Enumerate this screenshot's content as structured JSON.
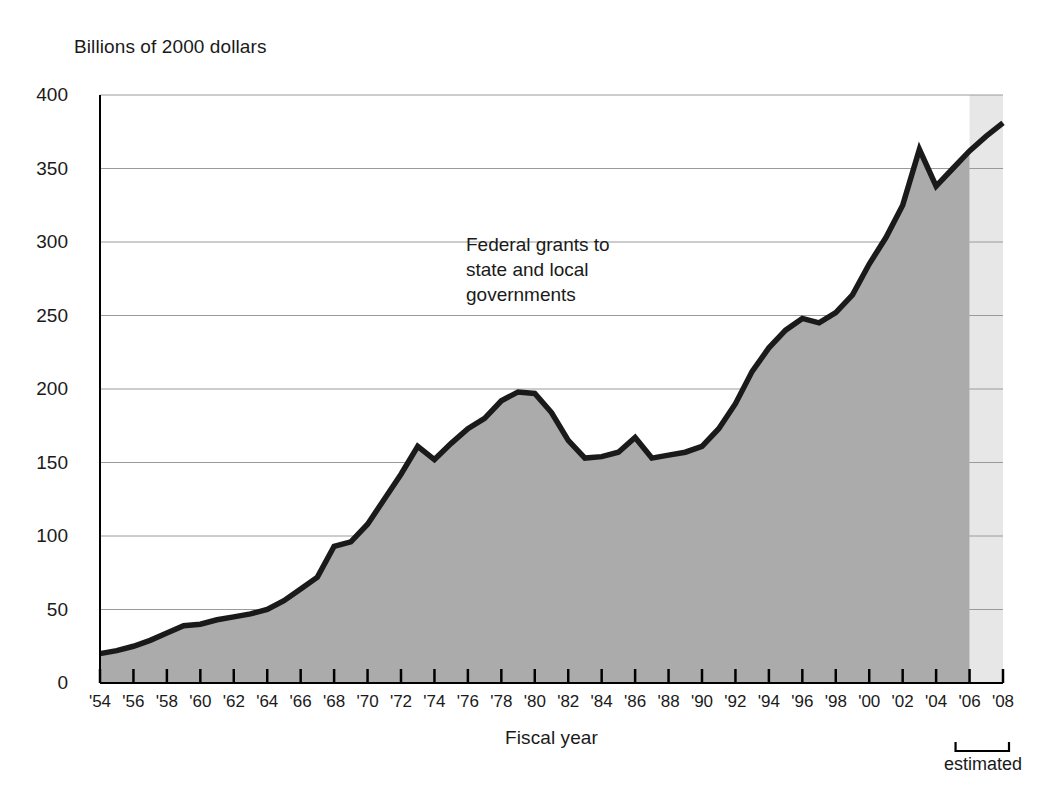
{
  "chart_data": {
    "type": "area",
    "title": "",
    "subtitle": "",
    "ylabel": "Billions of 2000 dollars",
    "xlabel": "Fiscal year",
    "annotation": [
      "Federal grants to",
      "state and local",
      "governments"
    ],
    "estimated_label": "estimated",
    "estimated_start_year": 2006,
    "estimated_end_year": 2008,
    "grid": true,
    "legend_position": "none",
    "ylim": [
      0,
      400
    ],
    "xlim": [
      1954,
      2008
    ],
    "ytick_values": [
      0,
      50,
      100,
      150,
      200,
      250,
      300,
      350,
      400
    ],
    "ytick_labels": [
      "0",
      "50",
      "100",
      "150",
      "200",
      "250",
      "300",
      "350",
      "400"
    ],
    "xtick_values": [
      1954,
      1956,
      1958,
      1960,
      1962,
      1964,
      1966,
      1968,
      1970,
      1972,
      1974,
      1976,
      1978,
      1980,
      1982,
      1984,
      1986,
      1988,
      1990,
      1992,
      1994,
      1996,
      1998,
      2000,
      2002,
      2004,
      2006,
      2008
    ],
    "xtick_labels": [
      "'54",
      "'56",
      "'58",
      "'60",
      "'62",
      "'64",
      "'66",
      "'68",
      "'70",
      "'72",
      "'74",
      "'76",
      "'78",
      "'80",
      "'82",
      "'84",
      "'86",
      "'88",
      "'90",
      "'92",
      "'94",
      "'96",
      "'98",
      "'00",
      "'02",
      "'04",
      "'06",
      "'08"
    ],
    "series": [
      {
        "name": "Federal grants to state and local governments",
        "x": [
          1954,
          1955,
          1956,
          1957,
          1958,
          1959,
          1960,
          1961,
          1962,
          1963,
          1964,
          1965,
          1966,
          1967,
          1968,
          1969,
          1970,
          1971,
          1972,
          1973,
          1974,
          1975,
          1976,
          1977,
          1978,
          1979,
          1980,
          1981,
          1982,
          1983,
          1984,
          1985,
          1986,
          1987,
          1988,
          1989,
          1990,
          1991,
          1992,
          1993,
          1994,
          1995,
          1996,
          1997,
          1998,
          1999,
          2000,
          2001,
          2002,
          2003,
          2004,
          2005,
          2006,
          2007,
          2008
        ],
        "values": [
          20,
          22,
          25,
          29,
          34,
          39,
          40,
          43,
          45,
          47,
          50,
          56,
          64,
          72,
          93,
          96,
          108,
          125,
          142,
          161,
          152,
          163,
          173,
          180,
          192,
          198,
          197,
          184,
          165,
          153,
          154,
          157,
          167,
          153,
          155,
          157,
          161,
          173,
          190,
          212,
          228,
          240,
          248,
          245,
          252,
          264,
          285,
          303,
          325,
          363,
          338,
          350,
          362,
          372,
          381
        ]
      }
    ]
  },
  "colors": {
    "area_fill": "#ababab",
    "estimated_fill": "#e7e7e7",
    "line": "#1a1a1a",
    "grid": "#9a9a9a",
    "axis": "#000000",
    "text": "#1a1a1a"
  }
}
